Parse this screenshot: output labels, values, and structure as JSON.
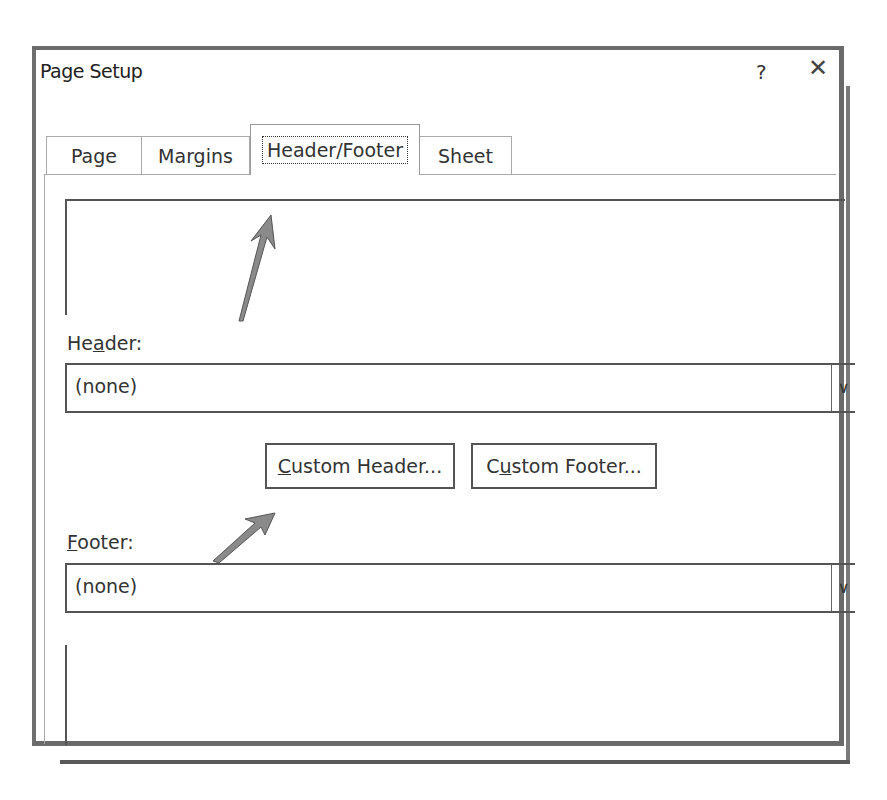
{
  "dialog": {
    "title": "Page Setup",
    "help_glyph": "?",
    "close_glyph": "✕"
  },
  "tabs": [
    {
      "label": "Page",
      "active": false
    },
    {
      "label": "Margins",
      "active": false
    },
    {
      "label": "Header/Footer",
      "active": true
    },
    {
      "label": "Sheet",
      "active": false
    }
  ],
  "header": {
    "label_pre": "He",
    "label_accel": "a",
    "label_post": "der:",
    "value": "(none)"
  },
  "footer": {
    "label_pre": "",
    "label_accel": "F",
    "label_post": "ooter:",
    "value": "(none)"
  },
  "buttons": {
    "custom_header_accel": "C",
    "custom_header_rest": "ustom Header...",
    "custom_footer_pre": "C",
    "custom_footer_accel": "u",
    "custom_footer_rest": "stom Footer..."
  },
  "dropdown_glyph": "∨",
  "annotations": {
    "arrow_color": "#8a8a8a"
  }
}
